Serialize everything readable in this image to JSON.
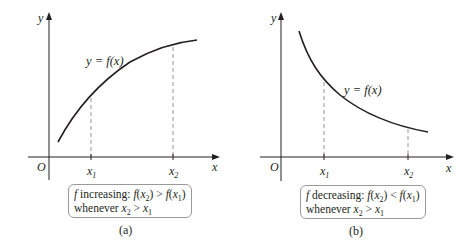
{
  "panels": [
    {
      "id": "a",
      "caption": "(a)",
      "axis_y_label": "y",
      "axis_x_label": "x",
      "origin_label": "O",
      "curve_label": "y = f(x)",
      "tick1_label": "x",
      "tick1_sub": "1",
      "tick2_label": "x",
      "tick2_sub": "2",
      "box": {
        "line1_prefix": "f",
        "line1_word": " increasing: ",
        "line1_rel": " > ",
        "line2_word": "whenever ",
        "line2_rel": " > "
      },
      "behavior": "increasing"
    },
    {
      "id": "b",
      "caption": "(b)",
      "axis_y_label": "y",
      "axis_x_label": "x",
      "origin_label": "O",
      "curve_label": "y = f(x)",
      "tick1_label": "x",
      "tick1_sub": "1",
      "tick2_label": "x",
      "tick2_sub": "2",
      "box": {
        "line1_prefix": "f",
        "line1_word": " decreasing: ",
        "line1_rel": " < ",
        "line2_word": "whenever ",
        "line2_rel": " > "
      },
      "behavior": "decreasing"
    }
  ],
  "colors": {
    "ink": "#231f20",
    "dash": "#8a8a8a",
    "box_border": "#9a9a9a"
  }
}
